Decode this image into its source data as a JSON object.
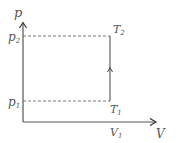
{
  "diagram": {
    "type": "p-V diagram",
    "axes": {
      "y_label": "p",
      "x_label": "V"
    },
    "levels": {
      "p2": {
        "main": "p",
        "sub": "2"
      },
      "p1": {
        "main": "p",
        "sub": "1"
      },
      "V1": {
        "main": "V",
        "sub": "1"
      }
    },
    "points": {
      "T2": {
        "main": "T",
        "sub": "2"
      },
      "T1": {
        "main": "T",
        "sub": "1"
      }
    },
    "process": "isochoric heating from T1 to T2 at constant V1 (arrow pointing up)",
    "colors": {
      "line": "#555555",
      "dashed": "#666666"
    }
  }
}
